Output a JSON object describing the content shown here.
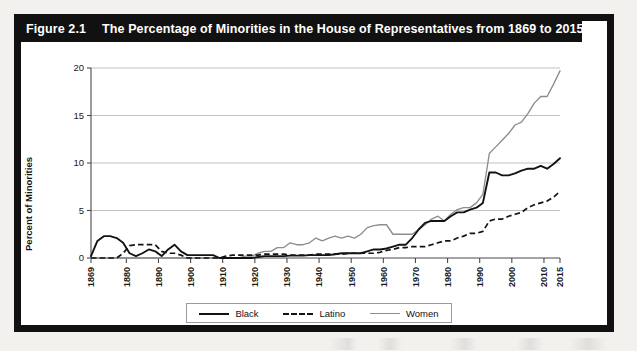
{
  "figure": {
    "number_label": "Figure 2.1",
    "title": "The Percentage of Minorities in the House of Representatives from 1869 to 2015"
  },
  "chart_data": {
    "type": "line",
    "title": "The Percentage of Minorities in the House of Representatives from 1869 to 2015",
    "xlabel": "Year",
    "ylabel": "Percent of Minorities",
    "xlim": [
      1869,
      2015
    ],
    "ylim": [
      0,
      20
    ],
    "yticks": [
      0,
      5,
      10,
      15,
      20
    ],
    "ytick_labels": [
      "0",
      "5",
      "10",
      "15",
      "20"
    ],
    "xticks": [
      1869,
      1880,
      1890,
      1900,
      1910,
      1920,
      1930,
      1940,
      1950,
      1960,
      1970,
      1980,
      1990,
      2000,
      2010,
      2015
    ],
    "xtick_labels": [
      "1869",
      "1880",
      "1890",
      "1900",
      "1910",
      "1920",
      "1930",
      "1940",
      "1950",
      "1960",
      "1970",
      "1980",
      "1990",
      "2000",
      "2010",
      "2015"
    ],
    "grid": "horizontal",
    "legend_position": "bottom-center",
    "colors": {
      "black_series": "#131313",
      "latino_series": "#131313",
      "women_series": "#8d8d8d",
      "grid": "#b9b9b9",
      "frame": "#111111",
      "title_bar_text": "#ffffff"
    },
    "x": [
      1869,
      1871,
      1873,
      1875,
      1877,
      1879,
      1881,
      1883,
      1885,
      1887,
      1889,
      1891,
      1893,
      1895,
      1897,
      1899,
      1901,
      1903,
      1905,
      1907,
      1909,
      1911,
      1913,
      1915,
      1917,
      1919,
      1921,
      1923,
      1925,
      1927,
      1929,
      1931,
      1933,
      1935,
      1937,
      1939,
      1941,
      1943,
      1945,
      1947,
      1949,
      1951,
      1953,
      1955,
      1957,
      1959,
      1961,
      1963,
      1965,
      1967,
      1969,
      1971,
      1973,
      1975,
      1977,
      1979,
      1981,
      1983,
      1985,
      1987,
      1989,
      1991,
      1993,
      1995,
      1997,
      1999,
      2001,
      2003,
      2005,
      2007,
      2009,
      2011,
      2013,
      2015
    ],
    "series": [
      {
        "name": "Black",
        "style": "solid",
        "color": "#131313",
        "values": [
          0.2,
          1.8,
          2.3,
          2.3,
          2.1,
          1.6,
          0.5,
          0.2,
          0.5,
          0.9,
          0.7,
          0.2,
          0.9,
          1.4,
          0.7,
          0.3,
          0.3,
          0.3,
          0.3,
          0.3,
          0.0,
          0.0,
          0.0,
          0.0,
          0.0,
          0.0,
          0.1,
          0.2,
          0.2,
          0.2,
          0.2,
          0.25,
          0.25,
          0.25,
          0.3,
          0.3,
          0.3,
          0.3,
          0.4,
          0.5,
          0.5,
          0.5,
          0.5,
          0.7,
          0.9,
          0.9,
          1.0,
          1.2,
          1.4,
          1.4,
          2.1,
          3.0,
          3.7,
          3.9,
          3.9,
          3.9,
          4.4,
          4.8,
          4.8,
          5.1,
          5.3,
          5.8,
          9.0,
          9.0,
          8.7,
          8.7,
          8.9,
          9.2,
          9.4,
          9.4,
          9.7,
          9.4,
          9.9,
          10.5
        ]
      },
      {
        "name": "Latino",
        "style": "dashed",
        "color": "#131313",
        "values": [
          0.0,
          0.0,
          0.0,
          0.0,
          0.0,
          0.5,
          1.3,
          1.4,
          1.4,
          1.4,
          1.4,
          0.7,
          0.5,
          0.5,
          0.3,
          0.0,
          0.0,
          0.0,
          0.0,
          0.0,
          0.0,
          0.2,
          0.3,
          0.3,
          0.3,
          0.3,
          0.3,
          0.4,
          0.4,
          0.4,
          0.4,
          0.3,
          0.3,
          0.3,
          0.3,
          0.4,
          0.4,
          0.4,
          0.4,
          0.4,
          0.5,
          0.5,
          0.5,
          0.5,
          0.5,
          0.6,
          0.8,
          0.9,
          1.1,
          1.1,
          1.2,
          1.2,
          1.2,
          1.4,
          1.6,
          1.8,
          1.8,
          2.1,
          2.3,
          2.6,
          2.6,
          2.8,
          3.9,
          4.1,
          4.1,
          4.4,
          4.6,
          4.8,
          5.3,
          5.6,
          5.8,
          6.0,
          6.4,
          7.0
        ]
      },
      {
        "name": "Women",
        "style": "solid",
        "color": "#8d8d8d",
        "values": [
          0.0,
          0.0,
          0.0,
          0.0,
          0.0,
          0.0,
          0.0,
          0.0,
          0.0,
          0.0,
          0.0,
          0.0,
          0.0,
          0.0,
          0.0,
          0.0,
          0.0,
          0.0,
          0.0,
          0.0,
          0.0,
          0.0,
          0.0,
          0.0,
          0.2,
          0.2,
          0.5,
          0.7,
          0.7,
          1.1,
          1.1,
          1.6,
          1.4,
          1.4,
          1.6,
          2.1,
          1.8,
          2.1,
          2.3,
          2.1,
          2.3,
          2.1,
          2.5,
          3.2,
          3.4,
          3.5,
          3.5,
          2.5,
          2.5,
          2.5,
          2.5,
          3.0,
          3.5,
          4.1,
          4.4,
          3.9,
          4.6,
          5.1,
          5.3,
          5.3,
          5.8,
          6.7,
          11.0,
          11.7,
          12.4,
          13.1,
          14.0,
          14.3,
          15.2,
          16.3,
          17.0,
          17.0,
          18.3,
          19.7
        ]
      }
    ]
  },
  "legend": {
    "items": [
      {
        "label": "Black",
        "swatch": "solid-black-line"
      },
      {
        "label": "Latino",
        "swatch": "dashed-black-line"
      },
      {
        "label": "Women",
        "swatch": "solid-gray-line"
      }
    ]
  }
}
